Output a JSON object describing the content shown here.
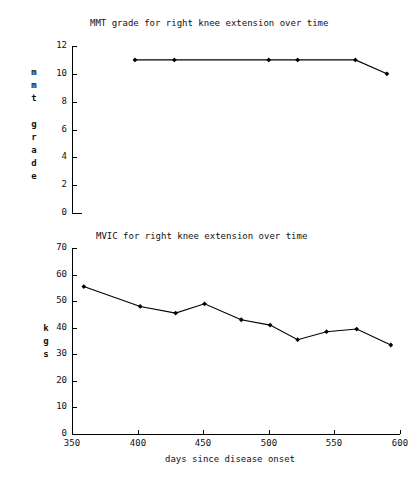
{
  "chart_data": [
    {
      "type": "line",
      "id": "mmt-chart",
      "title": "MMT grade for right knee extension over time",
      "xlabel": "",
      "ylabel": "mmt grade",
      "ylabel_letters": [
        "m",
        "m",
        "t",
        "",
        "g",
        "r",
        "a",
        "d",
        "e"
      ],
      "x": [
        398,
        428,
        500,
        522,
        566,
        590
      ],
      "values": [
        11,
        11,
        11,
        11,
        11,
        10
      ],
      "points": [
        {
          "x": 398,
          "y": 11
        },
        {
          "x": 428,
          "y": 11
        },
        {
          "x": 500,
          "y": 11
        },
        {
          "x": 522,
          "y": 11
        },
        {
          "x": 566,
          "y": 11
        },
        {
          "x": 590,
          "y": 10
        }
      ],
      "xlim": [
        350,
        600
      ],
      "ylim": [
        0,
        12
      ],
      "yticks": [
        0,
        2,
        4,
        6,
        8,
        10,
        12
      ],
      "ytick_labels": [
        "0",
        "2",
        "4",
        "6",
        "8",
        "10",
        "12"
      ],
      "xticks": [],
      "xtick_labels": [],
      "grid": false,
      "legend": "none",
      "marker": "diamond"
    },
    {
      "type": "line",
      "id": "mvic-chart",
      "title": "MVIC for right knee extension over time",
      "xlabel": "days since disease onset",
      "ylabel": "kgs",
      "ylabel_letters": [
        "k",
        "g",
        "s"
      ],
      "x": [
        359,
        402,
        429,
        451,
        479,
        501,
        522,
        544,
        567,
        593
      ],
      "values": [
        55.5,
        48,
        45.5,
        49,
        43,
        41,
        35.5,
        38.5,
        39.5,
        33.5
      ],
      "points": [
        {
          "x": 359,
          "y": 55.5
        },
        {
          "x": 402,
          "y": 48
        },
        {
          "x": 429,
          "y": 45.5
        },
        {
          "x": 451,
          "y": 49
        },
        {
          "x": 479,
          "y": 43
        },
        {
          "x": 501,
          "y": 41
        },
        {
          "x": 522,
          "y": 35.5
        },
        {
          "x": 544,
          "y": 38.5
        },
        {
          "x": 567,
          "y": 39.5
        },
        {
          "x": 593,
          "y": 33.5
        }
      ],
      "xlim": [
        350,
        600
      ],
      "ylim": [
        0,
        70
      ],
      "yticks": [
        0,
        10,
        20,
        30,
        40,
        50,
        60,
        70
      ],
      "ytick_labels": [
        "0",
        "10",
        "20",
        "30",
        "40",
        "50",
        "60",
        "70"
      ],
      "xticks": [
        350,
        400,
        450,
        500,
        550,
        600
      ],
      "xtick_labels": [
        "350",
        "400",
        "450",
        "500",
        "550",
        "600"
      ],
      "grid": false,
      "legend": "none",
      "marker": "diamond"
    }
  ],
  "colors": {
    "line": "#000000",
    "marker": "#000000",
    "axis": "#000000",
    "background": "#ffffff"
  }
}
